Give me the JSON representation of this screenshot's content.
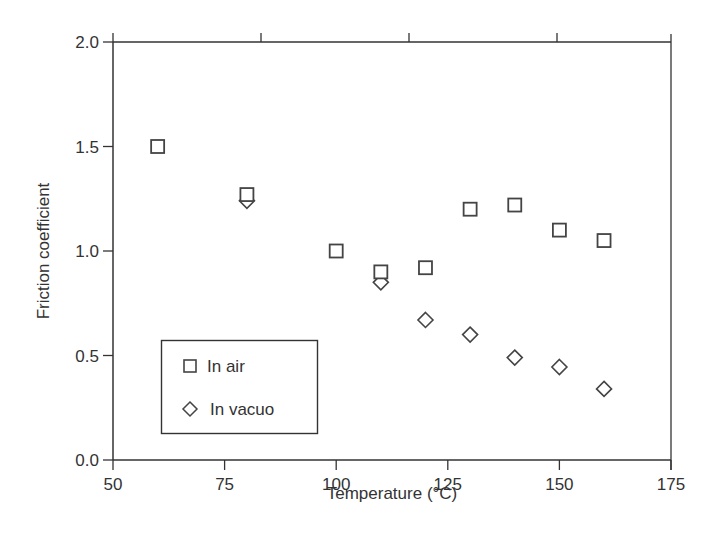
{
  "chart_data": {
    "type": "scatter",
    "title": "",
    "xlabel": "Temperature (°C)",
    "ylabel": "Friction coefficient",
    "xlim": [
      50,
      175
    ],
    "ylim": [
      0.0,
      2.0
    ],
    "x_ticks": [
      50,
      75,
      100,
      125,
      150,
      175
    ],
    "x_tick_labels": [
      "50",
      "75",
      "100",
      "125",
      "150",
      "175"
    ],
    "y_ticks": [
      0.0,
      0.5,
      1.0,
      1.5,
      2.0
    ],
    "y_tick_labels": [
      "0.0",
      "0.5",
      "1.0",
      "1.5",
      "2.0"
    ],
    "grid": false,
    "legend_position": "lower left (inside plot)",
    "series": [
      {
        "name": "In air",
        "marker": "square",
        "x": [
          60,
          80,
          100,
          110,
          120,
          130,
          140,
          150,
          160
        ],
        "values": [
          1.5,
          1.27,
          1.0,
          0.9,
          0.92,
          1.2,
          1.22,
          1.1,
          1.05
        ]
      },
      {
        "name": "In vacuo",
        "marker": "diamond",
        "x": [
          80,
          110,
          120,
          130,
          140,
          150,
          160
        ],
        "values": [
          1.24,
          0.85,
          0.67,
          0.6,
          0.49,
          0.445,
          0.34
        ]
      }
    ],
    "colors": {
      "axis": "#333333",
      "marker": "#444444",
      "background": "#ffffff"
    }
  }
}
